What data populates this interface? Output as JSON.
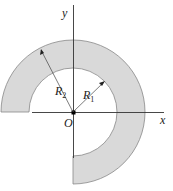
{
  "diagram": {
    "type": "three-quarter annulus cross-section",
    "colors": {
      "ring_fill": "#d9d9d9",
      "ring_stroke": "#777777",
      "axis": "#333333",
      "text": "#222222"
    },
    "labels": {
      "y_axis": "y",
      "x_axis": "x",
      "origin": "O",
      "inner_radius": "R",
      "inner_radius_sub": "1",
      "outer_radius": "R",
      "outer_radius_sub": "2"
    }
  }
}
